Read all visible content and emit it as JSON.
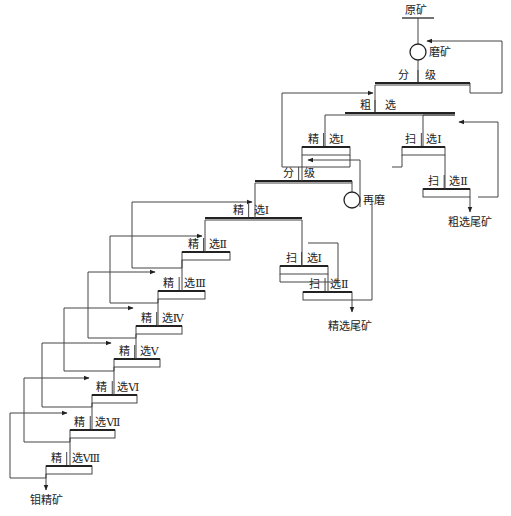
{
  "diagram": {
    "colors": {
      "line": "#444444",
      "text": "#222222",
      "background": "#ffffff"
    },
    "feed": {
      "label": "原矿",
      "x": 418,
      "y": 16
    },
    "mill": {
      "label": "磨矿",
      "cx": 418,
      "cy": 52,
      "r": 8
    },
    "regrind": {
      "label": "再磨",
      "cx": 352,
      "cy": 200,
      "r": 8
    },
    "stages": [
      {
        "id": "classify-1",
        "left": "分",
        "right": "级",
        "x1": 375,
        "x2": 470,
        "y": 83,
        "h": 0
      },
      {
        "id": "rougher",
        "left": "粗",
        "right": "选",
        "x1": 345,
        "x2": 455,
        "y": 113,
        "h": 0
      },
      {
        "id": "cleaner-1-primary",
        "left": "精",
        "right": "选Ⅰ",
        "x1": 302,
        "x2": 350,
        "y": 147,
        "h": 8
      },
      {
        "id": "scavenger-1-primary",
        "left": "扫",
        "right": "选Ⅰ",
        "x1": 402,
        "x2": 445,
        "y": 147,
        "h": 8
      },
      {
        "id": "scavenger-2-primary",
        "left": "扫",
        "right": "选Ⅱ",
        "x1": 423,
        "x2": 470,
        "y": 189,
        "h": 8
      },
      {
        "id": "classify-2",
        "left": "分",
        "right": "级",
        "x1": 255,
        "x2": 352,
        "y": 181,
        "h": 0
      },
      {
        "id": "cleaner-1",
        "left": "精",
        "right": "选Ⅰ",
        "x1": 205,
        "x2": 302,
        "y": 218,
        "h": 0
      },
      {
        "id": "cleaner-2",
        "left": "精",
        "right": "选Ⅱ",
        "x1": 182,
        "x2": 230,
        "y": 252,
        "h": 8
      },
      {
        "id": "scavenger-1",
        "left": "扫",
        "right": "选Ⅰ",
        "x1": 280,
        "x2": 328,
        "y": 266,
        "h": 8
      },
      {
        "id": "scavenger-2",
        "left": "扫",
        "right": "选Ⅱ",
        "x1": 303,
        "x2": 352,
        "y": 292,
        "h": 8
      },
      {
        "id": "cleaner-3",
        "left": "精",
        "right": "选Ⅲ",
        "x1": 158,
        "x2": 205,
        "y": 291,
        "h": 8
      },
      {
        "id": "cleaner-4",
        "left": "精",
        "right": "选Ⅳ",
        "x1": 136,
        "x2": 182,
        "y": 326,
        "h": 8
      },
      {
        "id": "cleaner-5",
        "left": "精",
        "right": "选Ⅴ",
        "x1": 114,
        "x2": 160,
        "y": 359,
        "h": 8
      },
      {
        "id": "cleaner-6",
        "left": "精",
        "right": "选Ⅵ",
        "x1": 92,
        "x2": 137,
        "y": 395,
        "h": 8
      },
      {
        "id": "cleaner-7",
        "left": "精",
        "right": "选Ⅶ",
        "x1": 70,
        "x2": 115,
        "y": 430,
        "h": 8
      },
      {
        "id": "cleaner-8",
        "left": "精",
        "right": "选Ⅷ",
        "x1": 46,
        "x2": 92,
        "y": 466,
        "h": 8
      }
    ],
    "products": [
      {
        "id": "rougher-tailings",
        "label": "粗选尾矿",
        "x": 458,
        "y": 224
      },
      {
        "id": "cleaner-tailings",
        "label": "精选尾矿",
        "x": 328,
        "y": 328
      },
      {
        "id": "mo-concentrate",
        "label": "钼精矿",
        "x": 46,
        "y": 502
      }
    ]
  }
}
